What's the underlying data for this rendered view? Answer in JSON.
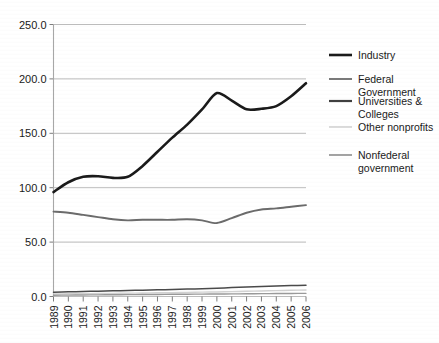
{
  "chart_data": {
    "type": "line",
    "title": "",
    "xlabel": "",
    "ylabel": "",
    "ylim": [
      0,
      250
    ],
    "ytick_step": 50,
    "grid": true,
    "legend_position": "right",
    "categories": [
      "1989",
      "1990",
      "1991",
      "1992",
      "1993",
      "1994",
      "1995",
      "1996",
      "1997",
      "1998",
      "1999",
      "2000",
      "2001",
      "2002",
      "2003",
      "2004",
      "2005",
      "2006"
    ],
    "ytick_labels": [
      "0.0",
      "50.0",
      "100.0",
      "150.0",
      "200.0",
      "250.0"
    ],
    "series": [
      {
        "name": "Industry",
        "color": "#1a1a1a",
        "width": 2.6,
        "values": [
          96.0,
          105.0,
          110.0,
          110.5,
          109.0,
          110.0,
          120.0,
          133.0,
          146.0,
          158.0,
          172.0,
          187.0,
          180.0,
          172.0,
          172.5,
          175.0,
          184.0,
          196.0
        ]
      },
      {
        "name": "Federal Government",
        "color": "#6b6b6b",
        "width": 1.9,
        "values": [
          78.0,
          77.0,
          75.0,
          73.0,
          71.0,
          70.0,
          70.5,
          70.5,
          70.5,
          71.0,
          70.0,
          67.5,
          72.0,
          77.0,
          80.0,
          81.0,
          82.5,
          84.0
        ]
      },
      {
        "name": "Universities & Colleges",
        "color": "#4a4a4a",
        "width": 1.5,
        "values": [
          4.0,
          4.3,
          4.6,
          4.9,
          5.2,
          5.5,
          5.8,
          6.1,
          6.4,
          6.8,
          7.2,
          7.6,
          8.2,
          8.7,
          9.2,
          9.6,
          10.0,
          10.4
        ]
      },
      {
        "name": "Other nonprofits",
        "color": "#d2d2d2",
        "width": 1.4,
        "values": [
          2.4,
          2.5,
          2.6,
          2.7,
          2.9,
          3.0,
          3.2,
          3.4,
          3.6,
          3.8,
          4.0,
          4.2,
          4.5,
          4.8,
          5.1,
          5.4,
          5.7,
          6.0
        ]
      },
      {
        "name": "Nonfederal government",
        "color": "#9a9a9a",
        "width": 1.4,
        "values": [
          1.2,
          1.3,
          1.4,
          1.5,
          1.6,
          1.7,
          1.8,
          1.9,
          2.0,
          2.1,
          2.2,
          2.3,
          2.4,
          2.5,
          2.6,
          2.7,
          2.8,
          2.9
        ]
      }
    ]
  },
  "legend": {
    "entries": [
      {
        "label": "Industry",
        "color": "#1a1a1a",
        "lines": [
          "Industry"
        ]
      },
      {
        "label": "Federal Government",
        "color": "#6b6b6b",
        "lines": [
          "Federal",
          "Government"
        ]
      },
      {
        "label": "Universities & Colleges",
        "color": "#3f3f3f",
        "lines": [
          "Universities &",
          "Colleges"
        ]
      },
      {
        "label": "Other nonprofits",
        "color": "#d8d8d8",
        "lines": [
          "Other nonprofits"
        ]
      },
      {
        "label": "Nonfederal government",
        "color": "#9a9a9a",
        "lines": [
          "Nonfederal",
          "government"
        ]
      }
    ]
  },
  "colors": {
    "background": "#ffffff",
    "grid": "#b4b4b4",
    "axis": "#a8a8a8",
    "text": "#1a1a1a"
  }
}
